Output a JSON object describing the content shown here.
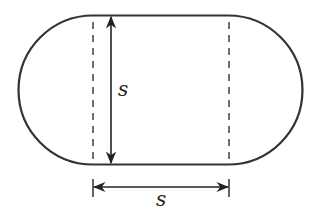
{
  "diagram": {
    "shape_color": "#333333",
    "labels": {
      "vertical_dimension": "s",
      "horizontal_dimension": "s"
    },
    "elements": [
      "stadium-outline",
      "left-dashed-divider",
      "right-dashed-divider",
      "vertical-double-arrow",
      "horizontal-double-arrow"
    ]
  }
}
